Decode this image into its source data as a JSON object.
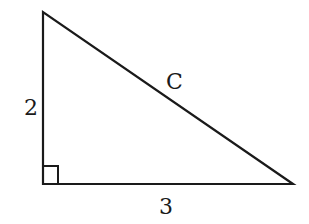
{
  "diagram": {
    "type": "right-triangle",
    "labels": {
      "vertical_leg": "2",
      "horizontal_leg": "3",
      "hypotenuse": "C"
    },
    "right_angle_marker": true,
    "colors": {
      "stroke": "#1a1a1a",
      "background": "#ffffff"
    }
  }
}
